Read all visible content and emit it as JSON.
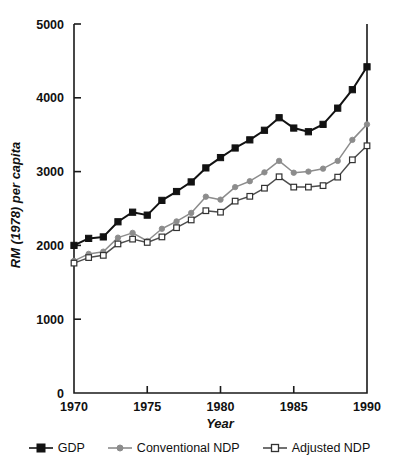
{
  "chart_data": {
    "type": "line",
    "title": "",
    "xlabel": "Year",
    "ylabel": "RM (1978) per capita",
    "xlim": [
      1970,
      1990
    ],
    "ylim": [
      0,
      5000
    ],
    "xticks": [
      1970,
      1975,
      1980,
      1985,
      1990
    ],
    "yticks": [
      0,
      1000,
      2000,
      3000,
      4000,
      5000
    ],
    "xtick_labels": [
      "1970",
      "1975",
      "1980",
      "1985",
      "1990"
    ],
    "ytick_labels": [
      "0",
      "1000",
      "2000",
      "3000",
      "4000",
      "5000"
    ],
    "grid": false,
    "legend_position": "below",
    "x": [
      1970,
      1971,
      1972,
      1973,
      1974,
      1975,
      1976,
      1977,
      1978,
      1979,
      1980,
      1981,
      1982,
      1983,
      1984,
      1985,
      1986,
      1987,
      1988,
      1989,
      1990
    ],
    "series": [
      {
        "name": "GDP",
        "color": "#121212",
        "marker": "filled-square",
        "values": [
          2000,
          2095,
          2115,
          2320,
          2450,
          2410,
          2610,
          2730,
          2860,
          3050,
          3190,
          3320,
          3430,
          3560,
          3730,
          3590,
          3540,
          3640,
          3860,
          4110,
          4420
        ]
      },
      {
        "name": "Conventional NDP",
        "color": "#8c8c8c",
        "marker": "filled-circle",
        "values": [
          1790,
          1885,
          1915,
          2105,
          2170,
          2060,
          2225,
          2325,
          2440,
          2660,
          2620,
          2790,
          2870,
          2990,
          3145,
          2985,
          3000,
          3040,
          3145,
          3430,
          3640
        ]
      },
      {
        "name": "Adjusted NDP",
        "color": "#4d4d4d",
        "marker": "open-square",
        "values": [
          1760,
          1835,
          1865,
          2020,
          2085,
          2040,
          2115,
          2240,
          2345,
          2470,
          2450,
          2600,
          2665,
          2775,
          2930,
          2790,
          2790,
          2810,
          2925,
          3160,
          3350
        ]
      }
    ]
  },
  "legend": {
    "items": [
      {
        "label": "GDP",
        "marker": "filled-square-marker",
        "color": "#121212"
      },
      {
        "label": "Conventional NDP",
        "marker": "filled-circle-marker",
        "color": "#8c8c8c"
      },
      {
        "label": "Adjusted NDP",
        "marker": "open-square-marker",
        "color": "#4d4d4d"
      }
    ]
  }
}
